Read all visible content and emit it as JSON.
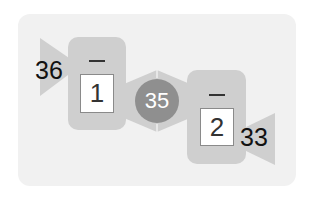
{
  "puzzle": {
    "start_value": "36",
    "step1": {
      "operator": "minus",
      "operator_symbol": "—",
      "operand": "1"
    },
    "middle_value": "35",
    "step2": {
      "operator": "minus",
      "operator_symbol": "—",
      "operand": "2"
    },
    "end_value": "33"
  },
  "colors": {
    "card_bg": "#f1f1f1",
    "shape_gray": "#cfcfcf",
    "circle_gray": "#8f8f8f"
  }
}
